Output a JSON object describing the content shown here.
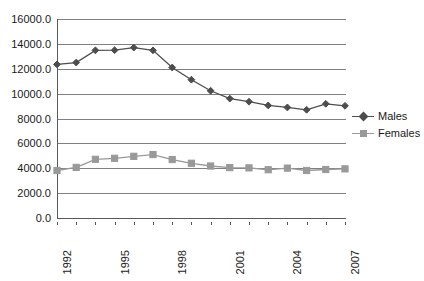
{
  "chart_data": {
    "type": "line",
    "title": "",
    "xlabel": "",
    "ylabel": "",
    "grid": true,
    "legend_position": "right",
    "x": [
      1992,
      1993,
      1994,
      1995,
      1996,
      1997,
      1998,
      1999,
      2000,
      2001,
      2002,
      2003,
      2004,
      2005,
      2006,
      2007
    ],
    "xtick_labels": [
      "1992",
      "",
      "",
      "1995",
      "",
      "",
      "1998",
      "",
      "",
      "2001",
      "",
      "",
      "2004",
      "",
      "",
      "2007"
    ],
    "ytick_labels": [
      "0.0",
      "2000.0",
      "4000.0",
      "6000.0",
      "8000.0",
      "10000.0",
      "12000.0",
      "14000.0",
      "16000.0"
    ],
    "ytick_values": [
      0,
      2000,
      4000,
      6000,
      8000,
      10000,
      12000,
      14000,
      16000
    ],
    "ylim": [
      0,
      16000
    ],
    "xlim": [
      1992,
      2007
    ],
    "series": [
      {
        "name": "Males",
        "color": "#4d4d4d",
        "marker": "diamond",
        "values": [
          12350,
          12500,
          13480,
          13490,
          13700,
          13480,
          12100,
          11120,
          10230,
          9600,
          9350,
          9050,
          8890,
          8700,
          9180,
          9020
        ]
      },
      {
        "name": "Females",
        "color": "#999999",
        "marker": "square",
        "values": [
          3820,
          4070,
          4720,
          4800,
          4960,
          5100,
          4700,
          4400,
          4180,
          4050,
          4030,
          3880,
          4010,
          3820,
          3900,
          3950
        ]
      }
    ]
  },
  "legend": {
    "entries": [
      {
        "label": "Males"
      },
      {
        "label": "Females"
      }
    ]
  },
  "colors": {
    "males": "#4d4d4d",
    "females": "#999999",
    "gridline": "#808080",
    "axis": "#595959",
    "text": "#1a1a1a",
    "background": "#ffffff"
  }
}
